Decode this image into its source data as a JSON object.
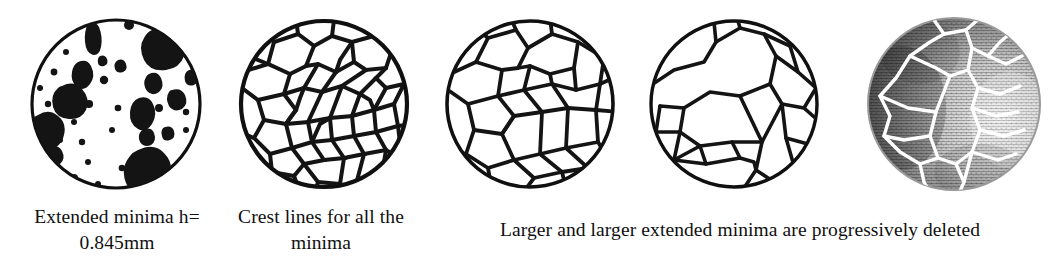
{
  "figure": {
    "panels": [
      {
        "id": "panel-extended-minima",
        "name": "extended-minima-binary-image",
        "kind": "binary-blobs",
        "caption": "Extended minima h= 0.845mm"
      },
      {
        "id": "panel-crest-lines-all",
        "name": "crest-lines-all-minima",
        "kind": "dense-watershed",
        "caption": "Crest lines for all the minima"
      },
      {
        "id": "panel-watershed-medium",
        "name": "watershed-medium-merge",
        "kind": "medium-watershed",
        "caption": ""
      },
      {
        "id": "panel-watershed-coarse",
        "name": "watershed-coarse-merge",
        "kind": "coarse-watershed",
        "caption": ""
      },
      {
        "id": "panel-grayscale-overlay",
        "name": "grayscale-texture-with-watershed-overlay",
        "kind": "grayscale-overlay",
        "caption": ""
      }
    ],
    "captions": {
      "caption_1_line_1": "Extended minima h=",
      "caption_1_line_2": "0.845mm",
      "caption_2_line_1": "Crest lines for all the",
      "caption_2_line_2": "minima",
      "caption_3": "Larger and larger extended minima are progressively deleted"
    },
    "colors": {
      "background": "#ffffff",
      "ink": "#101010",
      "blob_fill": "#141414",
      "circle_outline": "#101010",
      "overlay_line": "#ffffff",
      "texture_dark": "#4a4a4a",
      "texture_light": "#e8e8e8"
    },
    "measurements": {
      "h_value": "0.845mm"
    }
  }
}
